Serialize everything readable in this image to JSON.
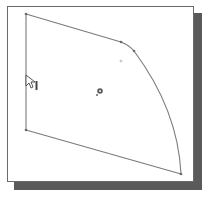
{
  "figure": {
    "type": "cad-sketch-profile",
    "frame": {
      "x": 7,
      "y": 6,
      "width": 187,
      "height": 176,
      "border_color": "#6a6a6a",
      "background": "#ffffff"
    },
    "shadow": {
      "offset_x": 7,
      "offset_y": 7,
      "color": "#5a5a5a"
    },
    "colors": {
      "line": "#7a7a7a",
      "vertex": "#6a6a6a",
      "origin": "#555555",
      "cursor": "#444444"
    },
    "vertices": [
      {
        "id": "top-left",
        "x": 26,
        "y": 14
      },
      {
        "id": "top-right-a",
        "x": 121,
        "y": 42
      },
      {
        "id": "top-right-b",
        "x": 134,
        "y": 51
      },
      {
        "id": "bottom-right",
        "x": 181,
        "y": 174
      },
      {
        "id": "bottom-left",
        "x": 26,
        "y": 130
      }
    ],
    "arc_center_point": {
      "x": 121,
      "y": 61
    },
    "origin_marker": {
      "x": 99,
      "y": 92
    },
    "cursor": {
      "x": 26,
      "y": 75,
      "glyph": "arrow-with-vertical-constraint"
    }
  }
}
